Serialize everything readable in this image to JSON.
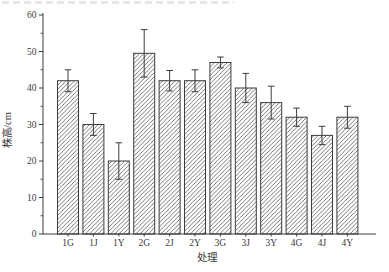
{
  "page": {
    "background": "#ffffff"
  },
  "chart_data": {
    "type": "bar",
    "categories": [
      "1G",
      "1J",
      "1Y",
      "2G",
      "2J",
      "2Y",
      "3G",
      "3J",
      "3Y",
      "4G",
      "4J",
      "4Y"
    ],
    "values": [
      42,
      30,
      20,
      49.5,
      42,
      42,
      47,
      40,
      36,
      32,
      27,
      32
    ],
    "errors": [
      3,
      3,
      5,
      6.5,
      2.8,
      3,
      1.5,
      4,
      4.5,
      2.5,
      2.5,
      3
    ],
    "title": "",
    "xlabel": "处理",
    "ylabel": "株高/cm",
    "ylim": [
      0,
      60
    ],
    "yticks": [
      0,
      10,
      20,
      30,
      40,
      50,
      60
    ],
    "ytick_step": 10,
    "yminor_step": 5,
    "grid": false,
    "legend": null,
    "error_bars": true,
    "bar_style": {
      "fill": "#ffffff",
      "hatch": "forward-diagonal",
      "stroke": "#3d3d3d"
    },
    "line_color": "#3d3d3d",
    "text_color": "#3a3a3a"
  }
}
